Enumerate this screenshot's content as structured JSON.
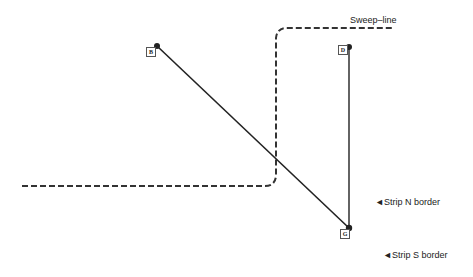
{
  "labels": {
    "sweep_line": "Sweep–line",
    "strip_n": "◄Strip N border",
    "strip_s": "◄Strip S border"
  },
  "points": {
    "B": {
      "label": "B",
      "x": 157,
      "y": 46
    },
    "D": {
      "label": "D",
      "x": 349,
      "y": 47
    },
    "G": {
      "label": "G",
      "x": 349,
      "y": 228
    }
  },
  "colors": {
    "line": "#222222",
    "dash": "#333333",
    "background": "#ffffff"
  }
}
